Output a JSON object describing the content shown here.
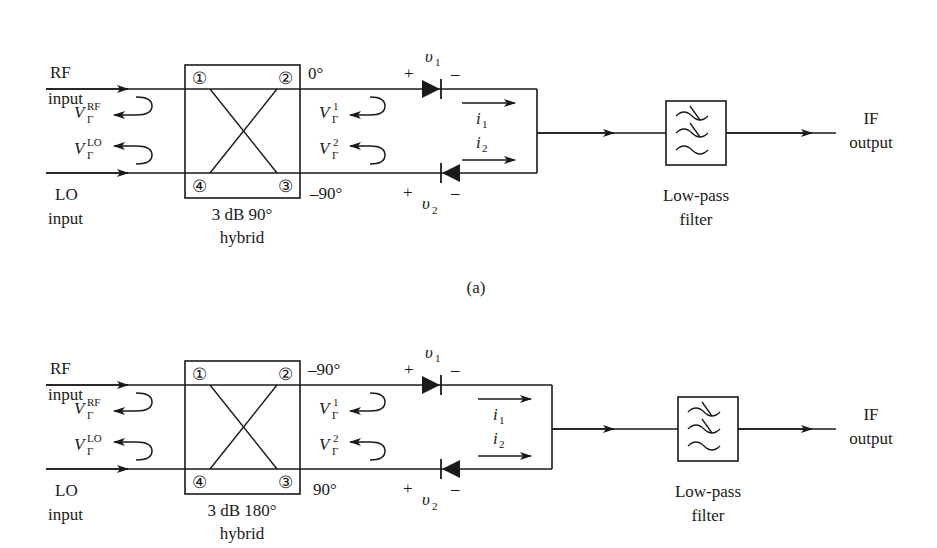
{
  "figure": {
    "subfigure_a": {
      "caption": "(a)",
      "rf_label_1": "RF",
      "rf_label_2": "input",
      "lo_label_1": "LO",
      "lo_label_2": "input",
      "v_rf": {
        "base": "V",
        "sub": "Γ",
        "sup": "RF"
      },
      "v_lo": {
        "base": "V",
        "sub": "Γ",
        "sup": "LO"
      },
      "ports": [
        "①",
        "②",
        "③",
        "④"
      ],
      "hybrid_label_1": "3 dB 90°",
      "hybrid_label_2": "hybrid",
      "phase_top": "0°",
      "phase_bottom": "–90°",
      "v1": {
        "base": "V",
        "sub": "Γ",
        "sup": "1"
      },
      "v2": {
        "base": "V",
        "sub": "Γ",
        "sup": "2"
      },
      "diode1": {
        "plus": "+",
        "minus": "–",
        "label": "υ",
        "sub": "1"
      },
      "diode2": {
        "plus": "+",
        "minus": "–",
        "label": "υ",
        "sub": "2"
      },
      "i1": {
        "base": "i",
        "sub": "1"
      },
      "i2": {
        "base": "i",
        "sub": "2"
      },
      "filter_label_1": "Low-pass",
      "filter_label_2": "filter",
      "output_label_1": "IF",
      "output_label_2": "output"
    },
    "subfigure_b": {
      "rf_label_1": "RF",
      "rf_label_2": "input",
      "lo_label_1": "LO",
      "lo_label_2": "input",
      "v_rf": {
        "base": "V",
        "sub": "Γ",
        "sup": "RF"
      },
      "v_lo": {
        "base": "V",
        "sub": "Γ",
        "sup": "LO"
      },
      "ports": [
        "①",
        "②",
        "③",
        "④"
      ],
      "hybrid_label_1": "3 dB 180°",
      "hybrid_label_2": "hybrid",
      "phase_top": "–90°",
      "phase_bottom": "90°",
      "v1": {
        "base": "V",
        "sub": "Γ",
        "sup": "1"
      },
      "v2": {
        "base": "V",
        "sub": "Γ",
        "sup": "2"
      },
      "diode1": {
        "plus": "+",
        "minus": "–",
        "label": "υ",
        "sub": "1"
      },
      "diode2": {
        "plus": "+",
        "minus": "–",
        "label": "υ",
        "sub": "2"
      },
      "i1": {
        "base": "i",
        "sub": "1"
      },
      "i2": {
        "base": "i",
        "sub": "2"
      },
      "filter_label_1": "Low-pass",
      "filter_label_2": "filter",
      "output_label_1": "IF",
      "output_label_2": "output"
    }
  }
}
